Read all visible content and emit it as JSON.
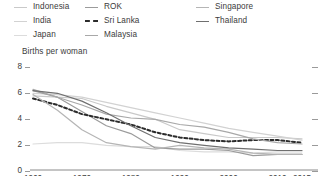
{
  "legend": {
    "columns": [
      {
        "items": [
          {
            "label": "Indonesia",
            "color": "#c9c9c9",
            "dash": false
          },
          {
            "label": "India",
            "color": "#d2d2d2",
            "dash": false
          },
          {
            "label": "Japan",
            "color": "#dcdcdc",
            "dash": false
          }
        ]
      },
      {
        "items": [
          {
            "label": "ROK",
            "color": "#9b9b9b",
            "dash": false
          },
          {
            "label": "Sri Lanka",
            "color": "#2b2b2b",
            "dash": true
          },
          {
            "label": "Malaysia",
            "color": "#a8a8a8",
            "dash": false
          }
        ]
      },
      {
        "items": [
          {
            "label": "Singapore",
            "color": "#b5b5b5",
            "dash": false
          },
          {
            "label": "Thailand",
            "color": "#6f6f6f",
            "dash": false
          }
        ]
      }
    ]
  },
  "axis_title": "Births per woman",
  "chart_data": {
    "type": "line",
    "title": "",
    "subtitle": "",
    "xlabel": "",
    "ylabel": "Births per woman",
    "xlim": [
      1960,
      2015
    ],
    "ylim": [
      0,
      8
    ],
    "yticks": [
      8,
      6,
      4,
      2,
      0
    ],
    "xticks": [
      1960,
      1970,
      1980,
      1990,
      2000,
      2010,
      2015
    ],
    "grid": false,
    "legend_position": "top",
    "x": [
      1960,
      1965,
      1970,
      1975,
      1980,
      1985,
      1990,
      1995,
      2000,
      2005,
      2010,
      2015
    ],
    "series": [
      {
        "name": "Indonesia",
        "color": "#c9c9c9",
        "dash": false,
        "values": [
          5.7,
          5.6,
          5.5,
          4.9,
          4.4,
          3.9,
          3.1,
          2.8,
          2.5,
          2.5,
          2.5,
          2.4
        ]
      },
      {
        "name": "India",
        "color": "#d2d2d2",
        "dash": false,
        "values": [
          5.9,
          5.8,
          5.6,
          5.2,
          4.8,
          4.4,
          4.0,
          3.6,
          3.2,
          2.9,
          2.6,
          2.3
        ]
      },
      {
        "name": "Japan",
        "color": "#dcdcdc",
        "dash": false,
        "values": [
          2.0,
          2.1,
          2.1,
          1.9,
          1.8,
          1.8,
          1.5,
          1.4,
          1.4,
          1.3,
          1.4,
          1.4
        ]
      },
      {
        "name": "ROK",
        "color": "#9b9b9b",
        "dash": false,
        "values": [
          6.1,
          5.6,
          4.5,
          3.4,
          2.8,
          1.7,
          1.6,
          1.6,
          1.5,
          1.1,
          1.2,
          1.2
        ]
      },
      {
        "name": "Sri Lanka",
        "color": "#2b2b2b",
        "dash": true,
        "values": [
          5.5,
          5.0,
          4.3,
          3.9,
          3.5,
          2.9,
          2.5,
          2.3,
          2.2,
          2.3,
          2.3,
          2.1
        ]
      },
      {
        "name": "Malaysia",
        "color": "#a8a8a8",
        "dash": false,
        "values": [
          6.2,
          5.6,
          5.0,
          4.3,
          4.0,
          3.9,
          3.5,
          3.3,
          2.9,
          2.4,
          2.1,
          2.0
        ]
      },
      {
        "name": "Singapore",
        "color": "#b5b5b5",
        "dash": false,
        "values": [
          5.8,
          4.6,
          3.1,
          2.1,
          1.8,
          1.6,
          1.9,
          1.7,
          1.6,
          1.3,
          1.2,
          1.2
        ]
      },
      {
        "name": "Thailand",
        "color": "#6f6f6f",
        "dash": false,
        "values": [
          6.1,
          5.9,
          5.3,
          4.4,
          3.4,
          2.5,
          2.1,
          1.9,
          1.7,
          1.6,
          1.5,
          1.5
        ]
      }
    ]
  }
}
